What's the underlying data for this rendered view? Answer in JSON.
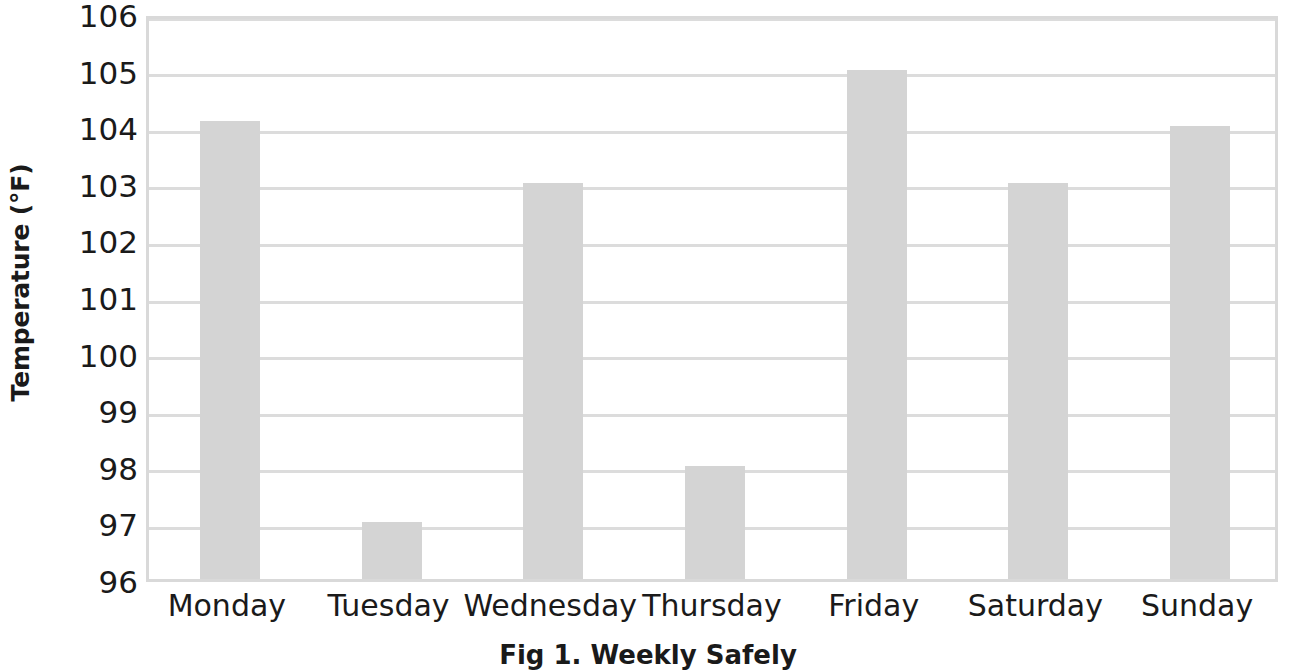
{
  "chart_data": {
    "type": "bar",
    "title": "",
    "categories": [
      "Monday",
      "Tuesday",
      "Wednesday",
      "Thursday",
      "Friday",
      "Saturday",
      "Sunday"
    ],
    "values": [
      104.1,
      97,
      103,
      98,
      105,
      103,
      104
    ],
    "series": [
      {
        "name": "Temperature",
        "values": [
          104.1,
          97,
          103,
          98,
          105,
          103,
          104
        ]
      }
    ],
    "xlabel": "",
    "ylabel": "Temperature (°F)",
    "ylim": [
      96,
      106
    ],
    "ytick_step": 1,
    "yticks": [
      106,
      105,
      104,
      103,
      102,
      101,
      100,
      99,
      98,
      97,
      96
    ],
    "ytick_labels": [
      "106",
      "105",
      "104",
      "103",
      "102",
      "101",
      "100",
      "99",
      "98",
      "97",
      "96"
    ],
    "grid": "horizontal",
    "legend": "none",
    "bar_color": "#d4d4d4",
    "gridline_color": "#dcdcdc",
    "axis_border_color": "#d9d9d9",
    "text_color": "#1a1a1a",
    "background_color": "#ffffff"
  },
  "caption": {
    "text": "Fig 1. Weekly Safely"
  }
}
